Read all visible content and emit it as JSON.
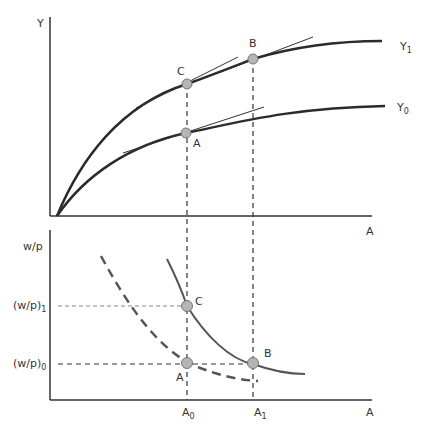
{
  "top_panel": {
    "y_axis_label": "Y",
    "x_axis_label": "A",
    "curves": [
      {
        "name": "Y1",
        "label_main": "Y",
        "label_sub": "1"
      },
      {
        "name": "Y0",
        "label_main": "Y",
        "label_sub": "0"
      }
    ],
    "points": {
      "C": "C",
      "B": "B",
      "A": "A"
    }
  },
  "bottom_panel": {
    "y_axis_label": "w/p",
    "x_axis_label": "A",
    "y_ticks": [
      {
        "main": "(w/p)",
        "sub": "1"
      },
      {
        "main": "(w/p)",
        "sub": "0"
      }
    ],
    "x_ticks": [
      {
        "main": "A",
        "sub": "0"
      },
      {
        "main": "A",
        "sub": "1"
      }
    ],
    "points": {
      "C": "C",
      "A": "A",
      "B": "B"
    }
  },
  "colors": {
    "axis": "#333333",
    "curve": "#2b2b2b",
    "demand_curve": "#555555",
    "point_fill": "#b5b5b5",
    "point_stroke": "#777777",
    "dashed_guide": "#333333",
    "light_dashed_guide": "#888888"
  }
}
